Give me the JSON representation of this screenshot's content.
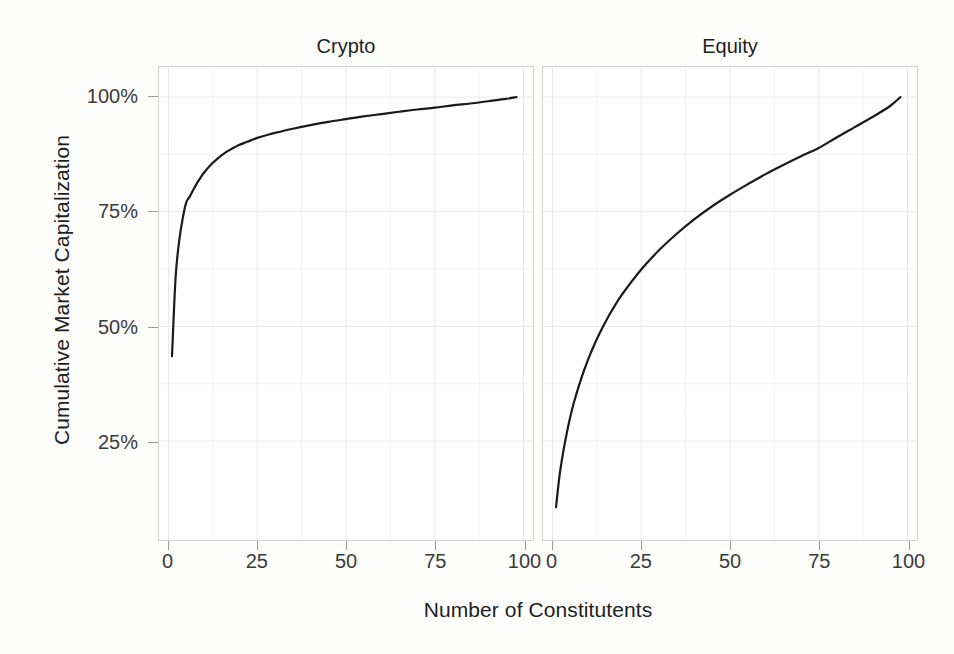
{
  "chart_data": {
    "type": "line",
    "title": "",
    "xlabel": "Number of Constitutents",
    "ylabel": "Cumulative Market Capitalization",
    "xlim": [
      0,
      100
    ],
    "ylim": [
      8,
      102
    ],
    "grid": true,
    "legend": "none",
    "facet_layout": "1 row x 2 columns",
    "x_ticks": [
      0,
      25,
      50,
      75,
      100
    ],
    "x_tick_labels": [
      "0",
      "25",
      "50",
      "75",
      "100"
    ],
    "y_ticks": [
      25,
      50,
      75,
      100
    ],
    "y_tick_labels": [
      "25%",
      "50%",
      "75%",
      "100%"
    ],
    "line_color": "#1a1a1a",
    "line_width": 2.2,
    "panels": [
      {
        "name": "crypto",
        "label": "Crypto",
        "x": [
          1,
          2,
          3,
          4,
          5,
          6,
          7,
          8,
          9,
          10,
          12,
          14,
          16,
          18,
          20,
          22,
          25,
          28,
          30,
          35,
          40,
          45,
          50,
          55,
          60,
          65,
          70,
          75,
          80,
          85,
          90,
          95,
          98
        ],
        "y": [
          43.5,
          60.5,
          68.5,
          73.5,
          77.0,
          78.3,
          79.8,
          81.2,
          82.4,
          83.5,
          85.3,
          86.7,
          87.9,
          88.8,
          89.6,
          90.2,
          91.1,
          91.8,
          92.2,
          93.1,
          93.9,
          94.6,
          95.2,
          95.8,
          96.3,
          96.8,
          97.3,
          97.7,
          98.2,
          98.6,
          99.1,
          99.6,
          100.0
        ]
      },
      {
        "name": "equity",
        "label": "Equity",
        "x": [
          1,
          2,
          3,
          4,
          5,
          6,
          8,
          10,
          12,
          14,
          16,
          18,
          20,
          25,
          30,
          35,
          40,
          45,
          50,
          55,
          60,
          65,
          70,
          75,
          80,
          85,
          90,
          95,
          98
        ],
        "y": [
          10.6,
          17.5,
          22.5,
          26.6,
          30.2,
          33.3,
          38.4,
          42.7,
          46.4,
          49.6,
          52.5,
          55.1,
          57.4,
          62.4,
          66.6,
          70.2,
          73.4,
          76.2,
          78.7,
          81.0,
          83.2,
          85.2,
          87.1,
          88.9,
          91.2,
          93.4,
          95.6,
          98.0,
          100.0
        ]
      }
    ]
  },
  "axes": {
    "y_title": "Cumulative Market Capitalization",
    "x_title": "Number of Constitutents"
  },
  "strips": {
    "left": "Crypto",
    "right": "Equity"
  },
  "ticks": {
    "y": [
      {
        "label": "100%",
        "value": 100
      },
      {
        "label": "75%",
        "value": 75
      },
      {
        "label": "50%",
        "value": 50
      },
      {
        "label": "25%",
        "value": 25
      }
    ],
    "x": [
      {
        "label": "0",
        "value": 0
      },
      {
        "label": "25",
        "value": 25
      },
      {
        "label": "50",
        "value": 50
      },
      {
        "label": "75",
        "value": 75
      },
      {
        "label": "100",
        "value": 100
      }
    ]
  },
  "style": {
    "line_color": "#1a1a1a",
    "grid_major_color": "#e8e8e8",
    "grid_minor_color": "#f2f2f2",
    "panel_border_color": "#d3d3d3",
    "panel_background": "#ffffff",
    "page_background": "#fdfdfc",
    "text_color": "#1d1d1d"
  }
}
